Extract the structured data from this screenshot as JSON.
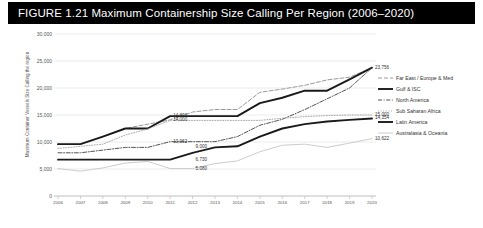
{
  "figure": {
    "title": "FIGURE 1.21  Maximum Containership Size Calling Per Region (2006–2020)"
  },
  "chart_data": {
    "type": "line",
    "title": "Maximum Containership Size Calling Per Region (2006–2020)",
    "xlabel": "",
    "ylabel": "Maximum Container Vessels Size Calling the region",
    "ylim": [
      0,
      30000
    ],
    "yticks": [
      0,
      5000,
      10000,
      15000,
      20000,
      25000,
      30000
    ],
    "ytick_labels": [
      "0",
      "5,000",
      "10,000",
      "15,000",
      "20,000",
      "25,000",
      "30,000"
    ],
    "grid": true,
    "legend_position": "right",
    "categories": [
      "2006",
      "2007",
      "2008",
      "2009",
      "2010",
      "2011",
      "2012",
      "2013",
      "2014",
      "2015",
      "2016",
      "2017",
      "2018",
      "2019",
      "2020"
    ],
    "series": [
      {
        "name": "Far East  /  Europe & Med",
        "style": "dashed",
        "color": "#9a9a9a",
        "values": [
          9600,
          9600,
          11000,
          12500,
          13300,
          14100,
          15550,
          16020,
          16020,
          19200,
          19800,
          20500,
          21500,
          22000,
          23756
        ]
      },
      {
        "name": "Gulf & ISC",
        "style": "solid-bold",
        "color": "#1a1a1a",
        "values": [
          9600,
          9600,
          11000,
          12500,
          12500,
          14800,
          14800,
          14800,
          14800,
          17200,
          18200,
          19500,
          19500,
          21600,
          23756
        ]
      },
      {
        "name": "North America",
        "style": "dash-dot",
        "color": "#555555",
        "values": [
          8000,
          8000,
          8500,
          9000,
          9000,
          10062,
          10062,
          10062,
          11000,
          13100,
          14200,
          16000,
          18000,
          20000,
          23756
        ]
      },
      {
        "name": "Sub Saharan Africa",
        "style": "dotted",
        "color": "#aaaaaa",
        "values": [
          8800,
          9200,
          9600,
          11300,
          12400,
          14000,
          14000,
          14000,
          14000,
          14000,
          14400,
          14700,
          14900,
          15000,
          15000
        ]
      },
      {
        "name": "Latin America",
        "style": "solid-bold",
        "color": "#1a1a1a",
        "values": [
          6730,
          6730,
          6730,
          6730,
          6730,
          6730,
          8000,
          9000,
          9200,
          11000,
          12500,
          13300,
          13800,
          14100,
          14354
        ]
      },
      {
        "name": "Australasia & Oceania",
        "style": "solid-light",
        "color": "#cccccc",
        "values": [
          5080,
          4600,
          5200,
          6100,
          6400,
          5080,
          5080,
          6000,
          6500,
          8200,
          9400,
          9600,
          9000,
          9800,
          10622
        ]
      }
    ],
    "data_labels": [
      {
        "text": "14,800",
        "x": 2011,
        "y": 14800
      },
      {
        "text": "14,000",
        "x": 2011,
        "y": 14000
      },
      {
        "text": "10,062",
        "x": 2011,
        "y": 10062
      },
      {
        "text": "9,000",
        "x": 2012,
        "y": 9000
      },
      {
        "text": "6,730",
        "x": 2012,
        "y": 6730
      },
      {
        "text": "5,080",
        "x": 2012,
        "y": 5080
      },
      {
        "text": "23,756",
        "x": 2020,
        "y": 23756
      },
      {
        "text": "15,000",
        "x": 2020,
        "y": 15000
      },
      {
        "text": "14,354",
        "x": 2020,
        "y": 14354
      },
      {
        "text": "10,622",
        "x": 2020,
        "y": 10622
      }
    ]
  }
}
